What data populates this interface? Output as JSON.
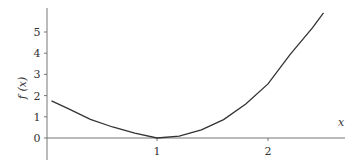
{
  "chart_data": {
    "type": "line",
    "title": "",
    "xlabel": "x",
    "ylabel": "f (x)",
    "xlim": [
      0,
      2.6
    ],
    "ylim": [
      -0.8,
      6
    ],
    "grid": false,
    "x_ticks": [
      "1",
      "2"
    ],
    "y_ticks": [
      "0",
      "1",
      "2",
      "3",
      "4",
      "5"
    ],
    "series": [
      {
        "name": "f(x)",
        "x": [
          0.05,
          0.2,
          0.4,
          0.6,
          0.8,
          1.0,
          1.2,
          1.4,
          1.6,
          1.8,
          2.0,
          2.2,
          2.4,
          2.5
        ],
        "values": [
          1.75,
          1.38,
          0.88,
          0.52,
          0.23,
          0.0,
          0.09,
          0.38,
          0.87,
          1.6,
          2.55,
          3.95,
          5.2,
          5.9
        ]
      }
    ]
  }
}
